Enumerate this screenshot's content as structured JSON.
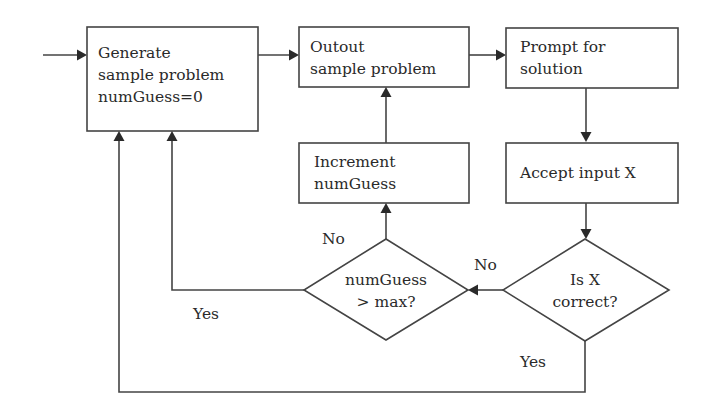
{
  "diagram": {
    "type": "flowchart",
    "nodes": {
      "generate": {
        "shape": "rect",
        "lines": [
          "Generate",
          "sample problem",
          "numGuess=0"
        ]
      },
      "output": {
        "shape": "rect",
        "lines": [
          "Outout",
          "sample problem"
        ]
      },
      "prompt": {
        "shape": "rect",
        "lines": [
          "Prompt for",
          "solution"
        ]
      },
      "accept": {
        "shape": "rect",
        "lines": [
          "Accept input X"
        ]
      },
      "increment": {
        "shape": "rect",
        "lines": [
          "Increment",
          "numGuess"
        ]
      },
      "check_max": {
        "shape": "diamond",
        "lines": [
          "numGuess",
          "> max?"
        ]
      },
      "check_correct": {
        "shape": "diamond",
        "lines": [
          "Is X",
          "correct?"
        ]
      }
    },
    "edges": [
      {
        "from": "start",
        "to": "generate",
        "label": ""
      },
      {
        "from": "generate",
        "to": "output",
        "label": ""
      },
      {
        "from": "output",
        "to": "prompt",
        "label": ""
      },
      {
        "from": "prompt",
        "to": "accept",
        "label": ""
      },
      {
        "from": "accept",
        "to": "check_correct",
        "label": ""
      },
      {
        "from": "check_correct",
        "to": "check_max",
        "label": "No"
      },
      {
        "from": "check_correct",
        "to": "generate",
        "label": "Yes"
      },
      {
        "from": "check_max",
        "to": "increment",
        "label": "No"
      },
      {
        "from": "check_max",
        "to": "generate",
        "label": "Yes"
      },
      {
        "from": "increment",
        "to": "output",
        "label": ""
      }
    ],
    "labels": {
      "max_no": "No",
      "max_yes": "Yes",
      "correct_no": "No",
      "correct_yes": "Yes"
    }
  }
}
